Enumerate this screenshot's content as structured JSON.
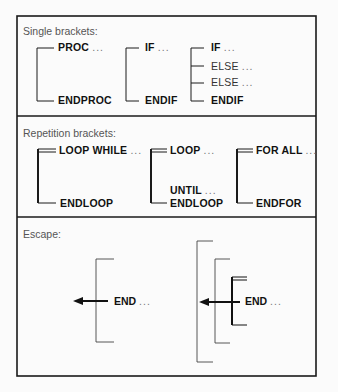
{
  "sections": {
    "single": {
      "heading": "Single brackets:",
      "proc": {
        "start": "PROC",
        "end": "ENDPROC"
      },
      "if": {
        "start": "IF",
        "end": "ENDIF"
      },
      "if_else": {
        "start": "IF",
        "else1": "ELSE",
        "else2": "ELSE",
        "end": "ENDIF"
      }
    },
    "repetition": {
      "heading": "Repetition brackets:",
      "loop_while": {
        "start": "LOOP WHILE",
        "end": "ENDLOOP"
      },
      "loop_until": {
        "start": "LOOP",
        "until": "UNTIL",
        "end": "ENDLOOP"
      },
      "for_all": {
        "start": "FOR ALL",
        "end": "ENDFOR"
      }
    },
    "escape": {
      "heading": "Escape:",
      "simple": {
        "label": "END"
      },
      "nested": {
        "label": "END"
      }
    }
  },
  "ellipsis": "...",
  "colors": {
    "line": "#1a1a1a",
    "thin_line": "#444444",
    "heading": "#555555",
    "text": "#111111"
  }
}
